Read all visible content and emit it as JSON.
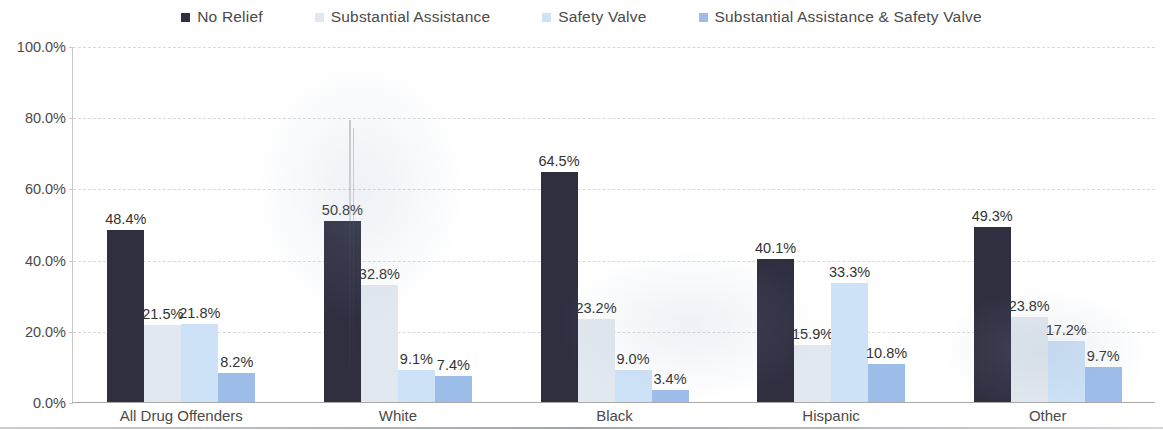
{
  "chart_data": {
    "type": "bar",
    "title": "",
    "xlabel": "",
    "ylabel": "",
    "ylim": [
      0,
      100
    ],
    "grid": true,
    "legend_position": "top",
    "y_ticks": [
      "0.0%",
      "20.0%",
      "40.0%",
      "60.0%",
      "80.0%",
      "100.0%"
    ],
    "y_tick_values": [
      0,
      20,
      40,
      60,
      80,
      100
    ],
    "categories": [
      "All Drug Offenders",
      "White",
      "Black",
      "Hispanic",
      "Other"
    ],
    "series": [
      {
        "name": "No Relief",
        "color": "#2f2f40",
        "values": [
          48.4,
          50.8,
          64.5,
          40.1,
          49.3
        ],
        "labels": [
          "48.4%",
          "50.8%",
          "64.5%",
          "40.1%",
          "49.3%"
        ]
      },
      {
        "name": "Substantial Assistance",
        "color": "#e2e8ef",
        "values": [
          21.5,
          32.8,
          23.2,
          15.9,
          23.8
        ],
        "labels": [
          "21.5%",
          "32.8%",
          "23.2%",
          "15.9%",
          "23.8%"
        ]
      },
      {
        "name": "Safety Valve",
        "color": "#cde2f6",
        "values": [
          21.8,
          9.1,
          9.0,
          33.3,
          17.2
        ],
        "labels": [
          "21.8%",
          "9.1%",
          "9.0%",
          "33.3%",
          "17.2%"
        ]
      },
      {
        "name": "Substantial Assistance & Safety Valve",
        "color": "#9dbde9",
        "values": [
          8.2,
          7.4,
          3.4,
          10.8,
          9.7
        ],
        "labels": [
          "8.2%",
          "7.4%",
          "3.4%",
          "10.8%",
          "9.7%"
        ]
      }
    ]
  },
  "legend": {
    "items": [
      {
        "label": "No Relief",
        "color": "#2f2f40",
        "icon": "square-marker-icon"
      },
      {
        "label": "Substantial Assistance",
        "color": "#e2e8ef",
        "icon": "square-marker-icon"
      },
      {
        "label": "Safety Valve",
        "color": "#cde2f6",
        "icon": "square-marker-icon"
      },
      {
        "label": "Substantial Assistance & Safety Valve",
        "color": "#9dbde9",
        "icon": "square-marker-icon"
      }
    ]
  }
}
